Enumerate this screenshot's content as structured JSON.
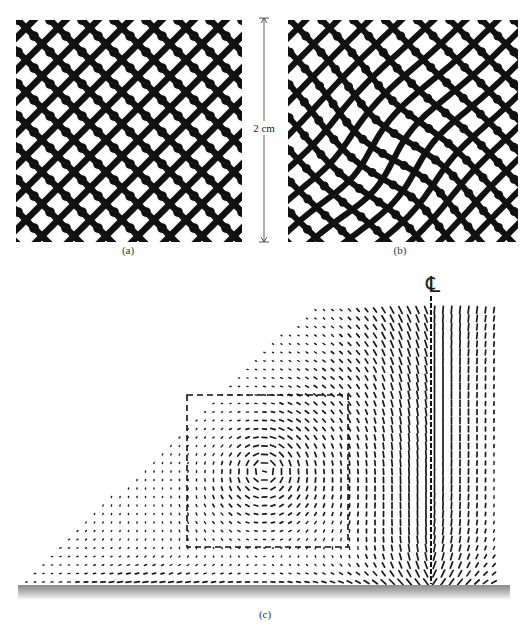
{
  "figure": {
    "panels": [
      {
        "id": "a",
        "label": "(a)",
        "description": "regular-diamond-mesh",
        "box": {
          "x": 16,
          "y": 20,
          "w": 226,
          "h": 222
        },
        "label_pos": {
          "x": 128,
          "y": 244
        },
        "mesh": {
          "spacing": 32,
          "stroke": 6.5,
          "distortion": 0
        }
      },
      {
        "id": "b",
        "label": "(b)",
        "description": "distorted-diamond-mesh",
        "box": {
          "x": 288,
          "y": 20,
          "w": 230,
          "h": 222
        },
        "label_pos": {
          "x": 400,
          "y": 244
        },
        "mesh": {
          "spacing": 32,
          "stroke": 6,
          "distortion": 1
        }
      },
      {
        "id": "c",
        "label": "(c)",
        "description": "velocity-vector-field",
        "label_pos": {
          "x": 265,
          "y": 608
        }
      }
    ],
    "scale_bar": {
      "label": "2 cm",
      "x": 264,
      "y_top": 18,
      "y_bottom": 242,
      "label_y": 128
    },
    "vector_field": {
      "region": {
        "top_y": 310,
        "bottom_y": 582,
        "left_x_bottom": 22,
        "left_x_top": 308,
        "right_x": 494
      },
      "grid_spacing": 8.5,
      "vortex_center": {
        "x": 265,
        "y": 470
      },
      "dashed_box": {
        "x": 187,
        "y": 395,
        "w": 161,
        "h": 152
      },
      "centerline": {
        "x": 431,
        "top_y": 296,
        "bottom_y": 584,
        "symbol": "℄"
      },
      "centerline_symbol_pos": {
        "x": 433,
        "y": 285
      },
      "ground": {
        "x": 18,
        "y": 585,
        "w": 492,
        "h": 14
      },
      "vector_color": "#1a1a1a"
    },
    "colors": {
      "ink": "#111111",
      "background": "#ffffff",
      "ground_dark": "#8c8c8c",
      "ground_light": "#f4f4f4"
    }
  }
}
